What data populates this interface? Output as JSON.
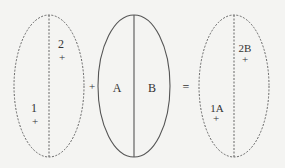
{
  "diagram": {
    "background": "#f4f4f2",
    "stroke_color": "#555555",
    "left_ellipse": {
      "style": "dashed",
      "points": [
        {
          "label": "2",
          "marker": "+"
        },
        {
          "label": "1",
          "marker": "+"
        }
      ]
    },
    "operator_plus": "+",
    "middle_ellipse": {
      "style": "solid",
      "halves": [
        "A",
        "B"
      ]
    },
    "operator_equals": "=",
    "right_ellipse": {
      "style": "dashed",
      "points": [
        {
          "label": "2B",
          "marker": "+"
        },
        {
          "label": "1A",
          "marker": "+"
        }
      ]
    }
  }
}
